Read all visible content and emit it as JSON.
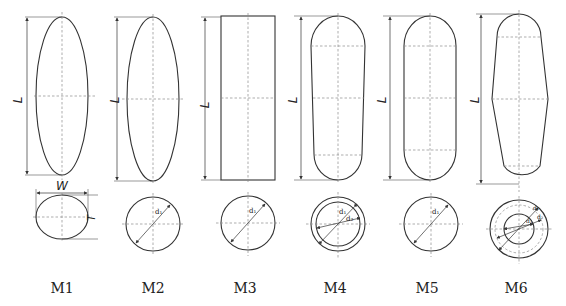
{
  "figure": {
    "models": [
      {
        "id": "M1",
        "caption": "M1",
        "side_shape": "ellipse",
        "section_shape": "ellipse",
        "length_label": "L",
        "section_labels": [
          "W",
          "T"
        ]
      },
      {
        "id": "M2",
        "caption": "M2",
        "side_shape": "ellipse",
        "section_shape": "circle",
        "length_label": "L",
        "section_labels": [
          "d1"
        ]
      },
      {
        "id": "M3",
        "caption": "M3",
        "side_shape": "rectangle",
        "section_shape": "circle",
        "length_label": "L",
        "section_labels": [
          "d1"
        ]
      },
      {
        "id": "M4",
        "caption": "M4",
        "side_shape": "tapered-capsule",
        "section_shape": "double-circle",
        "length_label": "L",
        "section_labels": [
          "d1",
          "d2"
        ]
      },
      {
        "id": "M5",
        "caption": "M5",
        "side_shape": "capsule",
        "section_shape": "circle",
        "length_label": "L",
        "section_labels": [
          "d1"
        ]
      },
      {
        "id": "M6",
        "caption": "M6",
        "side_shape": "double-tapered-capsule",
        "section_shape": "multi-circle",
        "length_label": "L",
        "section_labels": [
          "d1",
          "d2",
          "d3"
        ]
      }
    ],
    "labels": {
      "L": "L",
      "W": "W",
      "T": "T",
      "d1": "d₁",
      "d1_m4": "d₁",
      "d2_m4": "d₂",
      "d1_m6": "d₁",
      "d2_m6": "d₂",
      "d3_m6": "d₃"
    },
    "colors": {
      "stroke": "#333333",
      "centerline": "#8a8a8a",
      "background": "#ffffff"
    }
  }
}
